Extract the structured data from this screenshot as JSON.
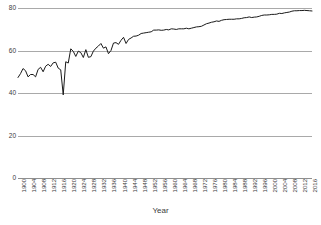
{
  "chart_data": {
    "type": "line",
    "title": "",
    "xlabel": "Year",
    "ylabel": "",
    "ylim": [
      0,
      80
    ],
    "yticks": [
      0,
      20,
      40,
      60,
      80
    ],
    "xlim": [
      1900,
      2017
    ],
    "grid": true,
    "legend": false,
    "line_color": "#1a1a1a",
    "gridline_color": "#a9a9a9",
    "xtick_labels": [
      "1900",
      "1904",
      "1908",
      "1912",
      "1916",
      "1920",
      "1924",
      "1928",
      "1932",
      "1936",
      "1940",
      "1944",
      "1948",
      "1952",
      "1956",
      "1960",
      "1964",
      "1968",
      "1972",
      "1976",
      "1980",
      "1984",
      "1988",
      "1992",
      "1996",
      "2000",
      "2004",
      "2008",
      "2012",
      "2016"
    ],
    "xtick_step": 4,
    "series": [
      {
        "name": "Life expectancy",
        "x": [
          1900,
          1901,
          1902,
          1903,
          1904,
          1905,
          1906,
          1907,
          1908,
          1909,
          1910,
          1911,
          1912,
          1913,
          1914,
          1915,
          1916,
          1917,
          1918,
          1919,
          1920,
          1921,
          1922,
          1923,
          1924,
          1925,
          1926,
          1927,
          1928,
          1929,
          1930,
          1931,
          1932,
          1933,
          1934,
          1935,
          1936,
          1937,
          1938,
          1939,
          1940,
          1941,
          1942,
          1943,
          1944,
          1945,
          1946,
          1947,
          1948,
          1949,
          1950,
          1951,
          1952,
          1953,
          1954,
          1955,
          1956,
          1957,
          1958,
          1959,
          1960,
          1961,
          1962,
          1963,
          1964,
          1965,
          1966,
          1967,
          1968,
          1969,
          1970,
          1971,
          1972,
          1973,
          1974,
          1975,
          1976,
          1977,
          1978,
          1979,
          1980,
          1981,
          1982,
          1983,
          1984,
          1985,
          1986,
          1987,
          1988,
          1989,
          1990,
          1991,
          1992,
          1993,
          1994,
          1995,
          1996,
          1997,
          1998,
          1999,
          2000,
          2001,
          2002,
          2003,
          2004,
          2005,
          2006,
          2007,
          2008,
          2009,
          2010,
          2011,
          2012,
          2013,
          2014,
          2015,
          2016,
          2017
        ],
        "values": [
          47.3,
          49.1,
          51.5,
          50.5,
          47.6,
          48.7,
          48.7,
          47.6,
          51.1,
          52.1,
          50.0,
          52.6,
          53.5,
          52.5,
          54.2,
          54.5,
          51.7,
          50.9,
          39.1,
          54.7,
          54.1,
          60.8,
          59.6,
          57.2,
          59.7,
          59.0,
          56.7,
          60.4,
          56.8,
          57.1,
          59.7,
          61.1,
          62.1,
          63.3,
          61.1,
          61.7,
          58.5,
          60.0,
          63.5,
          63.7,
          62.9,
          64.8,
          66.2,
          63.3,
          65.2,
          65.9,
          66.7,
          66.8,
          67.2,
          68.0,
          68.2,
          68.4,
          68.6,
          68.8,
          69.6,
          69.6,
          69.7,
          69.5,
          69.6,
          69.9,
          69.7,
          70.2,
          70.1,
          69.9,
          70.2,
          70.2,
          70.2,
          70.5,
          70.2,
          70.5,
          70.8,
          71.1,
          71.2,
          71.4,
          72.0,
          72.6,
          72.9,
          73.3,
          73.5,
          73.9,
          73.7,
          74.2,
          74.5,
          74.6,
          74.7,
          74.7,
          74.7,
          74.9,
          74.9,
          75.1,
          75.4,
          75.5,
          75.8,
          75.5,
          75.7,
          75.8,
          76.1,
          76.5,
          76.7,
          76.7,
          76.8,
          77.0,
          77.0,
          77.1,
          77.5,
          77.4,
          77.7,
          77.9,
          78.1,
          78.5,
          78.7,
          78.7,
          78.8,
          78.8,
          78.9,
          78.8,
          78.7,
          78.6
        ]
      }
    ]
  }
}
